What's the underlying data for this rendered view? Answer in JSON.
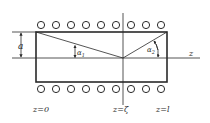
{
  "diagram": {
    "type": "solenoid-cross-section",
    "colors": {
      "stroke": "#2a2a2a",
      "background": "#ffffff"
    },
    "rectangle": {
      "x1": 36,
      "y1": 32,
      "x2": 167,
      "y2": 82
    },
    "axis": {
      "y": 58,
      "x_start": 12,
      "x_end": 200,
      "label": "z"
    },
    "vertical_line": {
      "x": 123,
      "y_start": 13,
      "y_end": 105
    },
    "coils": {
      "top_row_y": 25,
      "bottom_row_y": 89,
      "radius": 3.6,
      "x_positions": [
        41,
        56,
        71,
        86,
        101,
        116,
        131,
        146,
        161
      ]
    },
    "labels": {
      "radius": "a",
      "alpha1": "α",
      "alpha1_sub": "1",
      "alpha2": "α",
      "alpha2_sub": "2",
      "z_axis": "z",
      "z0": "z=0",
      "zeta": "z=ζ",
      "zl": "z=l"
    }
  }
}
